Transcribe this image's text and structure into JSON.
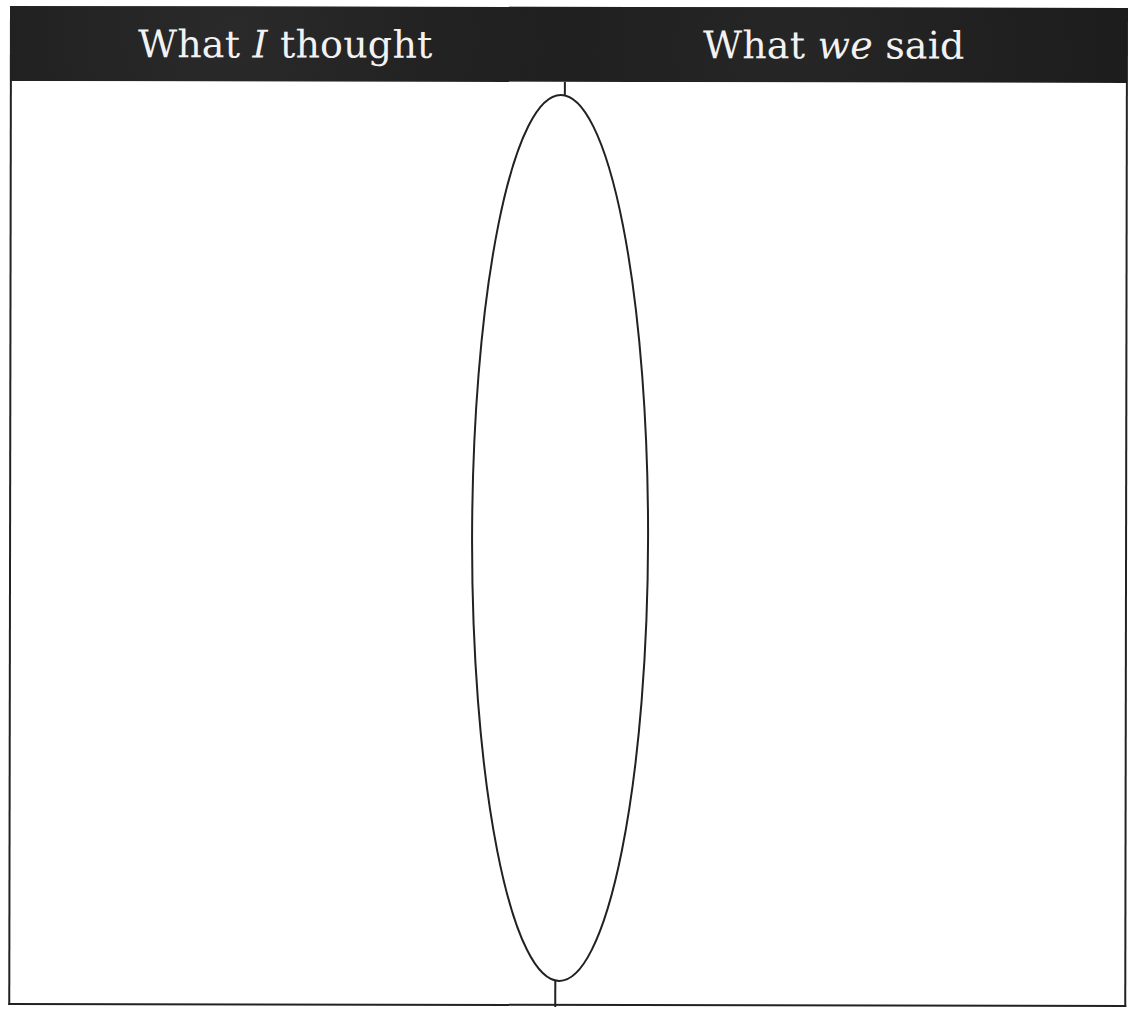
{
  "header": {
    "left": {
      "pre": "What ",
      "emph": "I",
      "post": " thought"
    },
    "right": {
      "pre": "What ",
      "emph": "we",
      "post": " said"
    }
  },
  "colors": {
    "header_bg": "#1c1c1c",
    "header_text": "#f2f2f2",
    "line": "#222222"
  }
}
